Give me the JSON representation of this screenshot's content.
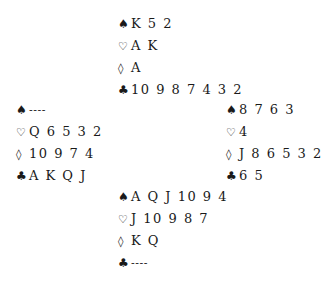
{
  "diagram": {
    "type": "bridge-deal",
    "suit_symbols": {
      "spades": "♠",
      "hearts": "♡",
      "diamonds": "◊",
      "clubs": "♣"
    },
    "hands": {
      "north": {
        "spades": "K 5 2",
        "hearts": "A K",
        "diamonds": "A",
        "clubs": "10 9 8 7 4 3 2"
      },
      "west": {
        "spades": "----",
        "hearts": "Q 6 5 3 2",
        "diamonds": "10 9 7 4",
        "clubs": "A K Q J"
      },
      "east": {
        "spades": "8 7 6 3",
        "hearts": "4",
        "diamonds": "J 8 6 5 3 2",
        "clubs": "6 5"
      },
      "south": {
        "spades": "A Q J 10 9 4",
        "hearts": "J 10 9 8 7",
        "diamonds": "K Q",
        "clubs": "----"
      }
    }
  }
}
